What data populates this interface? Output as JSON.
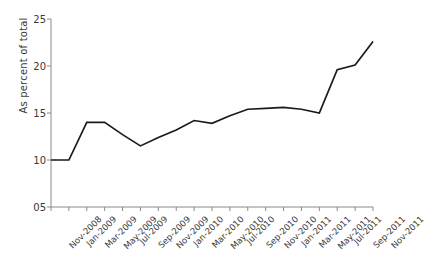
{
  "chart_data": {
    "type": "line",
    "title": "",
    "xlabel": "",
    "ylabel": "As percent of total",
    "ylim": [
      5,
      25
    ],
    "yticks": [
      "05",
      "10",
      "15",
      "20",
      "25"
    ],
    "ytick_values": [
      5,
      10,
      15,
      20,
      25
    ],
    "grid": false,
    "legend": "none",
    "line_color": "#1a1a1a",
    "axis_color": "#8a8a8a",
    "categories": [
      "Nov-2008",
      "Jan-2009",
      "Mar-2009",
      "May-2009",
      "Jul-2009",
      "Sep-2009",
      "Nov-2009",
      "Jan-2010",
      "Mar-2010",
      "May-2010",
      "Jul-2010",
      "Sep-2010",
      "Nov-2010",
      "Jan-2011",
      "Mar-2011",
      "May-2011",
      "Jul-2011",
      "Sep-2011",
      "Nov-2011"
    ],
    "values": [
      10.0,
      10.0,
      14.0,
      14.0,
      12.7,
      11.5,
      12.4,
      13.2,
      14.2,
      13.9,
      14.7,
      15.4,
      15.5,
      15.6,
      15.4,
      15.0,
      19.6,
      20.1,
      22.6
    ]
  }
}
